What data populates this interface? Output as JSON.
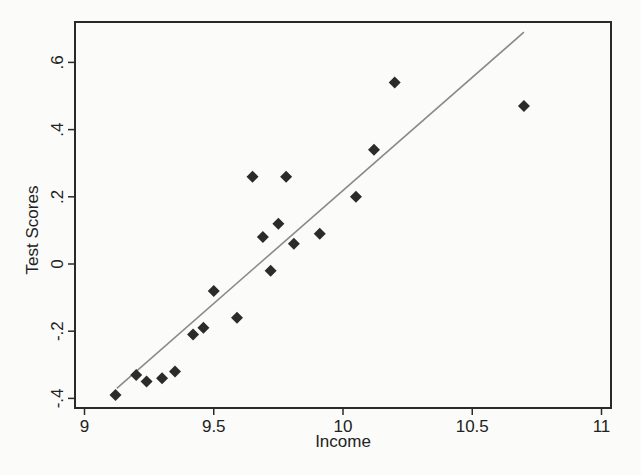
{
  "chart_data": {
    "type": "scatter",
    "title": "",
    "xlabel": "Income",
    "ylabel": "Test Scores",
    "xlim": [
      9,
      11
    ],
    "ylim": [
      -0.4,
      0.6
    ],
    "x_ticks": [
      9,
      9.5,
      10,
      10.5,
      11
    ],
    "x_tick_labels": [
      "9",
      "9.5",
      "10",
      "10.5",
      "11"
    ],
    "y_ticks": [
      -0.4,
      -0.2,
      0,
      0.2,
      0.4,
      0.6
    ],
    "y_tick_labels": [
      "-.4",
      "-.2",
      "0",
      ".2",
      ".4",
      ".6"
    ],
    "grid": false,
    "legend": null,
    "marker": "diamond",
    "series": [
      {
        "name": "observations",
        "points": [
          {
            "x": 9.12,
            "y": -0.39
          },
          {
            "x": 9.2,
            "y": -0.33
          },
          {
            "x": 9.24,
            "y": -0.35
          },
          {
            "x": 9.3,
            "y": -0.34
          },
          {
            "x": 9.35,
            "y": -0.32
          },
          {
            "x": 9.42,
            "y": -0.21
          },
          {
            "x": 9.46,
            "y": -0.19
          },
          {
            "x": 9.5,
            "y": -0.08
          },
          {
            "x": 9.59,
            "y": -0.16
          },
          {
            "x": 9.65,
            "y": 0.26
          },
          {
            "x": 9.69,
            "y": 0.08
          },
          {
            "x": 9.72,
            "y": -0.02
          },
          {
            "x": 9.75,
            "y": 0.12
          },
          {
            "x": 9.78,
            "y": 0.26
          },
          {
            "x": 9.81,
            "y": 0.06
          },
          {
            "x": 9.91,
            "y": 0.09
          },
          {
            "x": 10.05,
            "y": 0.2
          },
          {
            "x": 10.12,
            "y": 0.34
          },
          {
            "x": 10.2,
            "y": 0.54
          },
          {
            "x": 10.7,
            "y": 0.47
          }
        ]
      }
    ],
    "fit_line": {
      "name": "fitted values",
      "x": [
        9.125,
        10.7
      ],
      "y": [
        -0.37,
        0.69
      ]
    }
  }
}
